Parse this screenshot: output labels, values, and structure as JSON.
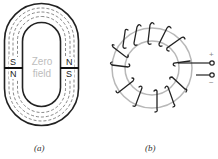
{
  "figure_a": {
    "caption": "(a)",
    "center_label_line1": "Zero",
    "center_label_line2": "field",
    "left_gap": {
      "upper_pole": "S",
      "lower_pole": "N"
    },
    "right_gap": {
      "upper_pole": "N",
      "lower_pole": "S"
    }
  },
  "figure_b": {
    "caption": "(b)",
    "terminal_positive": "+",
    "terminal_negative": "−",
    "turns": 12
  },
  "colors": {
    "core_outline": "#222222",
    "field_lines": "#555555",
    "zero_field_text": "#bdbdbd",
    "toroid_core": "#b8b8b8",
    "winding": "#222222"
  }
}
